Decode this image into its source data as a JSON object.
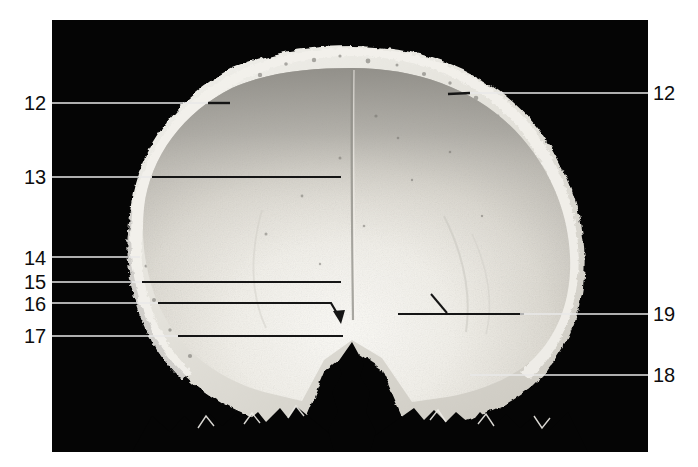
{
  "figure": {
    "background_color": "#ffffff",
    "photo_background_color": "#050505",
    "label_color": "#0d0d0d",
    "leader_line_colors": {
      "on_dark": "#e8e8e8",
      "on_bone": "#111111"
    }
  },
  "labels": [
    {
      "id": "12-left",
      "text": "12",
      "side": "left",
      "x": 24,
      "y": 93,
      "leader_y": 103,
      "leader_from": 52,
      "leader_to": 228
    },
    {
      "id": "13",
      "text": "13",
      "side": "left",
      "x": 24,
      "y": 167,
      "leader_y": 177,
      "leader_from": 52,
      "leader_to": 341
    },
    {
      "id": "14",
      "text": "14",
      "side": "left",
      "x": 24,
      "y": 248,
      "leader_y": 257,
      "leader_from": 52,
      "leader_to": 140
    },
    {
      "id": "15",
      "text": "15",
      "side": "left",
      "x": 24,
      "y": 272,
      "leader_y": 282,
      "leader_from": 52,
      "leader_to": 341
    },
    {
      "id": "16",
      "text": "16",
      "side": "left",
      "x": 24,
      "y": 294,
      "leader_y": 303,
      "leader_from": 52,
      "leader_to": 331
    },
    {
      "id": "17",
      "text": "17",
      "side": "left",
      "x": 24,
      "y": 326,
      "leader_y": 336,
      "leader_from": 52,
      "leader_to": 343
    },
    {
      "id": "12-right",
      "text": "12",
      "side": "right",
      "x": 653,
      "y": 83,
      "leader_y": 93,
      "leader_from": 455,
      "leader_to": 648
    },
    {
      "id": "19",
      "text": "19",
      "side": "right",
      "x": 653,
      "y": 304,
      "leader_y": 314,
      "leader_from": 398,
      "leader_to": 648
    },
    {
      "id": "18",
      "text": "18",
      "side": "right",
      "x": 653,
      "y": 365,
      "leader_y": 375,
      "leader_from": 470,
      "leader_to": 648
    }
  ],
  "annotations": {
    "arrow_16": {
      "name": "arrowhead-label-16",
      "bend_x": 331,
      "bend_y": 303,
      "tip_x": 341,
      "tip_y": 322
    },
    "tick_19": {
      "name": "tick-mark-label-19",
      "x1": 447,
      "y1": 313,
      "x2": 431,
      "y2": 294
    }
  },
  "specimen": {
    "name": "cranial-vault-section",
    "outer_bone_color": "#e9e7e2",
    "inner_table_light": "#f1efe9",
    "inner_table_dark": "#9a9892",
    "suture_color": "#b9b6ae",
    "diploe_color": "#d8d5cd"
  }
}
